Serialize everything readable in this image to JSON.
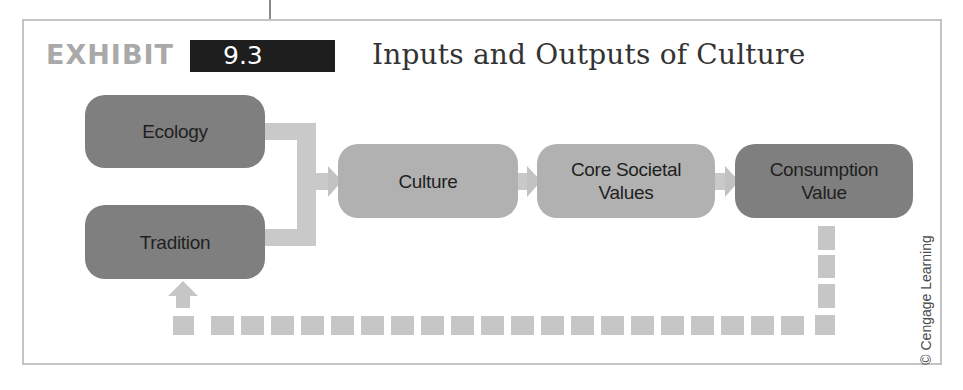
{
  "exhibit": {
    "label": "EXHIBIT",
    "number": "9.3",
    "title": "Inputs and Outputs of Culture"
  },
  "nodes": {
    "ecology": "Ecology",
    "tradition": "Tradition",
    "culture": "Culture",
    "core_line1": "Core Societal",
    "core_line2": "Values",
    "consumption_line1": "Consumption",
    "consumption_line2": "Value"
  },
  "edges": [
    {
      "from": "Ecology",
      "to": "Culture",
      "style": "solid"
    },
    {
      "from": "Tradition",
      "to": "Culture",
      "style": "solid"
    },
    {
      "from": "Culture",
      "to": "Core Societal Values",
      "style": "solid"
    },
    {
      "from": "Core Societal Values",
      "to": "Consumption Value",
      "style": "solid"
    },
    {
      "from": "Consumption Value",
      "to": "Tradition",
      "style": "dashed"
    }
  ],
  "copyright": "© Cengage Learning",
  "colors": {
    "dark_node": "#7f7f7f",
    "light_node": "#b1b1b1",
    "connector": "#c9c9c9",
    "number_box": "#1e1e1e",
    "exhibit_label": "#a9a9a9"
  }
}
